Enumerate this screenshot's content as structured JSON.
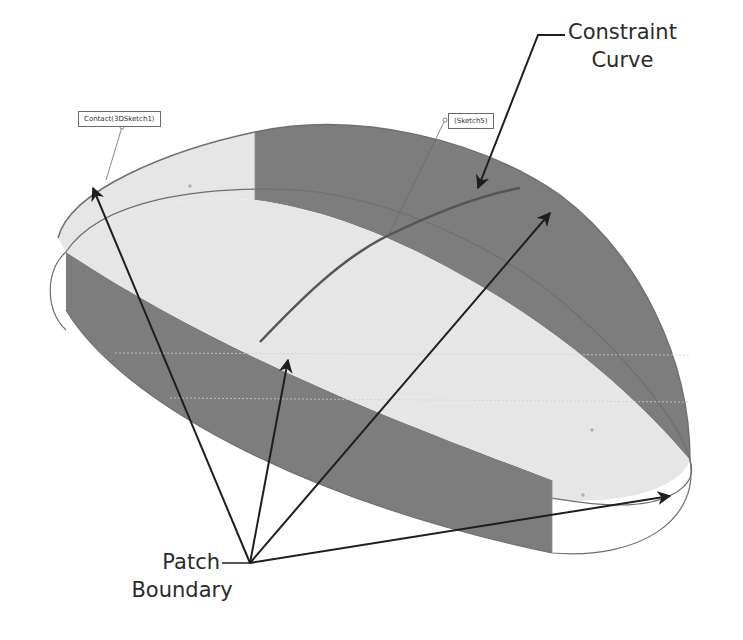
{
  "diagram": {
    "type": "annotated-3d-surface",
    "callouts": {
      "constraint_curve": {
        "line1": "Constraint",
        "line2": "Curve"
      },
      "patch_boundary": {
        "line1": "Patch",
        "line2": "Boundary"
      }
    },
    "tags": {
      "contact": "Contact(3DSketch1)",
      "sketch": "(Sketch5)"
    },
    "colors": {
      "light_face": "#e6e6e6",
      "dark_face": "#7d7d7d",
      "edge": "#6f6f6f",
      "arrow": "#1e1e1e",
      "background": "#ffffff"
    }
  }
}
